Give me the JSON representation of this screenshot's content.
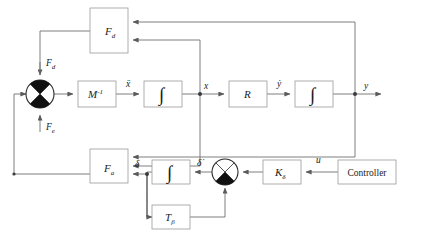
{
  "diagram": {
    "type": "block-diagram",
    "canvas": {
      "width": 424,
      "height": 243
    },
    "colors": {
      "background": "#ffffff",
      "wire": "#6f6f6f",
      "box_stroke": "#9a9a9a",
      "box_fill": "#ffffff",
      "text": "#1b1b1b",
      "junction_fill": "#111111"
    },
    "blocks": [
      {
        "id": "fd",
        "label": "F",
        "sub": "d",
        "kind": "transfer",
        "x": 90,
        "y": 8,
        "w": 38,
        "h": 45
      },
      {
        "id": "minv",
        "label": "M",
        "sup": "-1",
        "kind": "transfer",
        "x": 78,
        "y": 81,
        "w": 38,
        "h": 26
      },
      {
        "id": "int1",
        "label": "∫",
        "kind": "integrator",
        "x": 144,
        "y": 81,
        "w": 38,
        "h": 26
      },
      {
        "id": "r",
        "label": "R",
        "kind": "transfer",
        "x": 229,
        "y": 81,
        "w": 38,
        "h": 26
      },
      {
        "id": "int2",
        "label": "∫",
        "kind": "integrator",
        "x": 295,
        "y": 81,
        "w": 38,
        "h": 26
      },
      {
        "id": "fa",
        "label": "F",
        "sub": "a",
        "kind": "transfer",
        "x": 90,
        "y": 149,
        "w": 38,
        "h": 34
      },
      {
        "id": "int3",
        "label": "∫",
        "kind": "integrator",
        "x": 152,
        "y": 160,
        "w": 38,
        "h": 24
      },
      {
        "id": "tbeta",
        "label": "T",
        "sub": "β",
        "kind": "transfer",
        "x": 152,
        "y": 205,
        "w": 38,
        "h": 24
      },
      {
        "id": "kdelta",
        "label": "K",
        "sub": "δ",
        "kind": "gain",
        "x": 263,
        "y": 160,
        "w": 38,
        "h": 24
      },
      {
        "id": "controller",
        "label": "Controller",
        "kind": "source",
        "x": 338,
        "y": 160,
        "w": 58,
        "h": 24
      }
    ],
    "junctions": [
      {
        "id": "sum-left",
        "cx": 40,
        "cy": 94,
        "r": 14,
        "filled_quadrants": [
          "top",
          "bottom"
        ]
      },
      {
        "id": "sum-right",
        "cx": 225,
        "cy": 172,
        "r": 13,
        "filled_quadrants": [
          "bottom"
        ]
      }
    ],
    "signal_labels": [
      {
        "id": "fd-input",
        "text": "F",
        "sub": "d",
        "x": 46,
        "y": 66
      },
      {
        "id": "fe-input",
        "text": "F",
        "sub": "e",
        "x": 46,
        "y": 128
      },
      {
        "id": "xddot",
        "text": "ẍ",
        "x": 126,
        "y": 86
      },
      {
        "id": "x-signal",
        "text": "x",
        "x": 205,
        "y": 88
      },
      {
        "id": "ydot",
        "text": "ẏ",
        "x": 277,
        "y": 86
      },
      {
        "id": "y-signal",
        "text": "y",
        "x": 365,
        "y": 88
      },
      {
        "id": "delta",
        "text": "δ",
        "x": 137,
        "y": 165
      },
      {
        "id": "deltadot",
        "text": "δ̇",
        "x": 199,
        "y": 164
      },
      {
        "id": "u-signal",
        "text": "u",
        "x": 317,
        "y": 162
      }
    ],
    "block_titles": {
      "fd": "F_d aerodynamic disturbance-force block",
      "minv": "M inverse mass matrix block",
      "int1": "first integrator",
      "r": "R transformation block",
      "int2": "second integrator",
      "fa": "F_a actuator force block",
      "int3": "third integrator",
      "tbeta": "T beta block",
      "kdelta": "K delta gain block",
      "controller": "controller block"
    }
  }
}
